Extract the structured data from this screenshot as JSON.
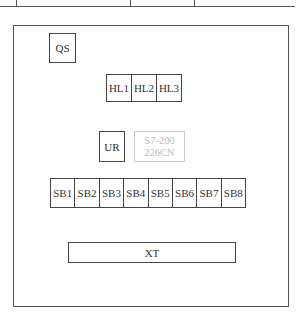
{
  "top_table_fragment": {
    "column_dividers_x": [
      16,
      130,
      194
    ]
  },
  "panel": {
    "qs": {
      "label": "QS"
    },
    "indicator_lights": [
      {
        "label": "HL1"
      },
      {
        "label": "HL2"
      },
      {
        "label": "HL3"
      }
    ],
    "ur": {
      "label": "UR"
    },
    "plc": {
      "line1": "S7-200",
      "line2": "226CN"
    },
    "buttons": [
      {
        "label": "SB1"
      },
      {
        "label": "SB2"
      },
      {
        "label": "SB3"
      },
      {
        "label": "SB4"
      },
      {
        "label": "SB5"
      },
      {
        "label": "SB6"
      },
      {
        "label": "SB7"
      },
      {
        "label": "SB8"
      }
    ],
    "terminal": {
      "label": "XT"
    }
  }
}
